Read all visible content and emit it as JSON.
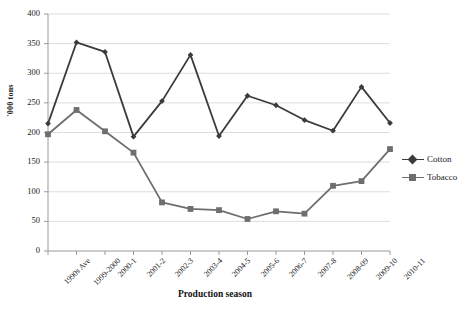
{
  "chart_data": {
    "type": "line",
    "title": "",
    "xlabel": "Production season",
    "ylabel": "'000 tons",
    "ylim": [
      0,
      400
    ],
    "yticks": [
      0,
      50,
      100,
      150,
      200,
      250,
      300,
      350,
      400
    ],
    "grid": true,
    "legend_position": "right",
    "categories": [
      "1990s Ave",
      "1999-2000",
      "2000-1",
      "2001-2",
      "2002-3",
      "2003-4",
      "2004-5",
      "2005-6",
      "2006-7",
      "2007-8",
      "2008-09",
      "2009-10",
      "2010-11"
    ],
    "series": [
      {
        "name": "Cotton",
        "color": "#3b3b3b",
        "marker": "diamond",
        "values": [
          215,
          352,
          336,
          193,
          253,
          331,
          194,
          262,
          246,
          221,
          203,
          277,
          216
        ]
      },
      {
        "name": "Tobacco",
        "color": "#6e6e6e",
        "marker": "square",
        "values": [
          197,
          238,
          202,
          166,
          82,
          71,
          69,
          54,
          67,
          63,
          110,
          118,
          172
        ]
      }
    ]
  },
  "colors": {
    "cotton": "#3b3b3b",
    "tobacco": "#6e6e6e",
    "grid": "#d4d4d4",
    "axis": "#9a9a9a",
    "text": "#1a1a1a"
  },
  "legend": {
    "items": [
      {
        "label": "Cotton"
      },
      {
        "label": "Tobacco"
      }
    ]
  }
}
